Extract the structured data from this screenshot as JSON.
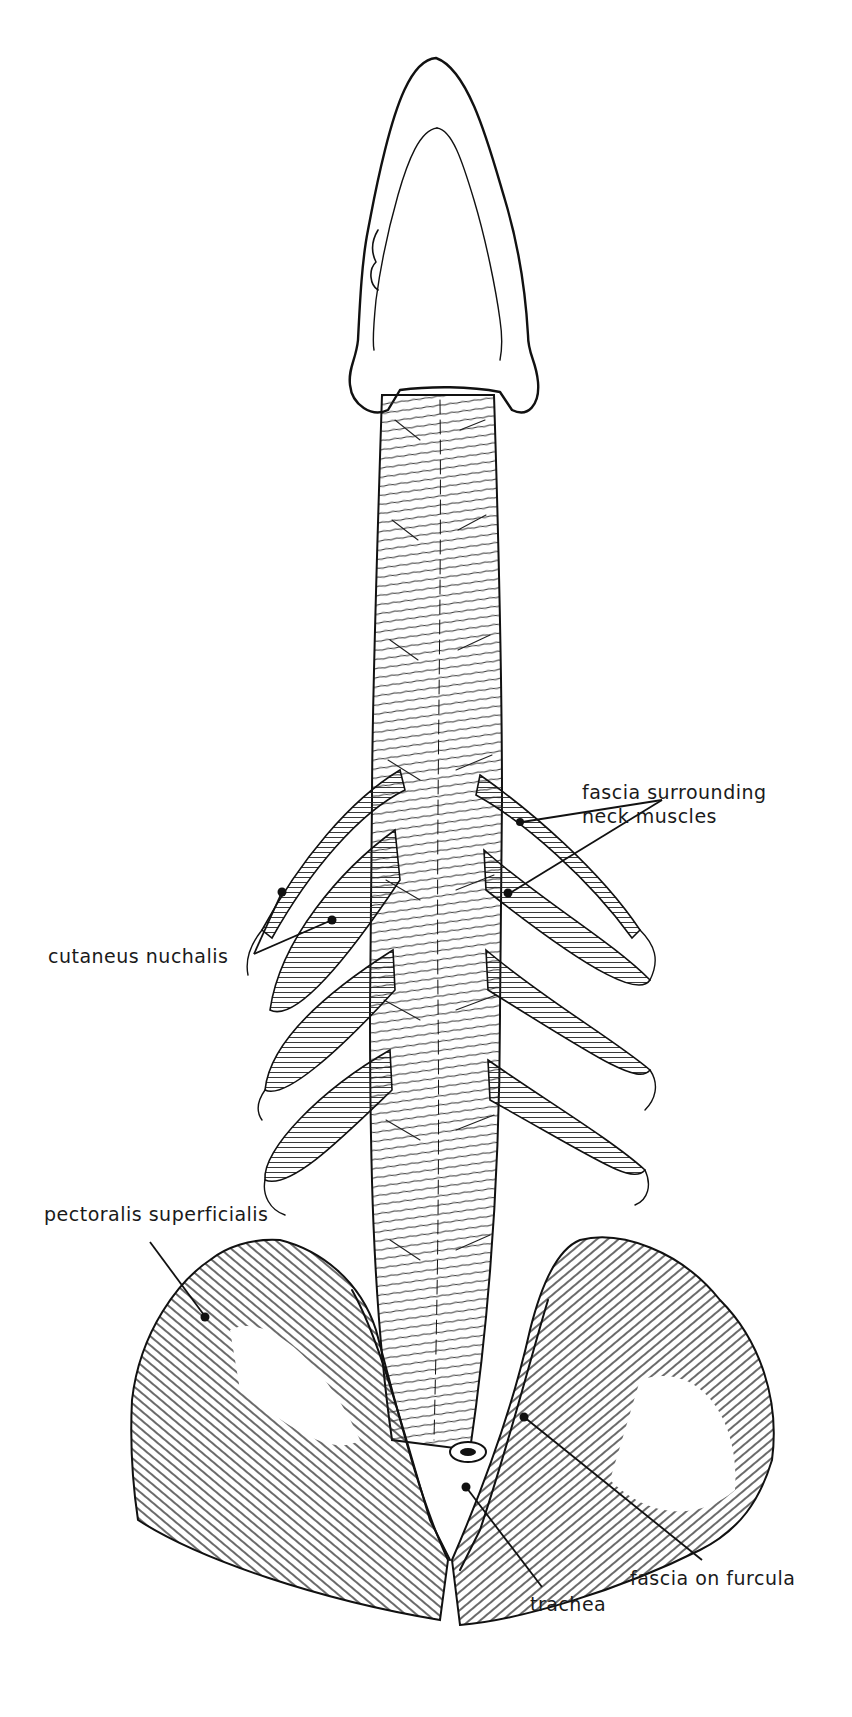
{
  "figure": {
    "ink_color": "#111111",
    "background": "#ffffff"
  },
  "labels": {
    "fascia_neck": {
      "line1": "fascia surrounding",
      "line2": "neck muscles"
    },
    "cutaneus_nuchalis": "cutaneus nuchalis",
    "pectoralis_superficialis": "pectoralis superficialis",
    "fascia_furcula": "fascia on furcula",
    "trachea": "trachea"
  }
}
